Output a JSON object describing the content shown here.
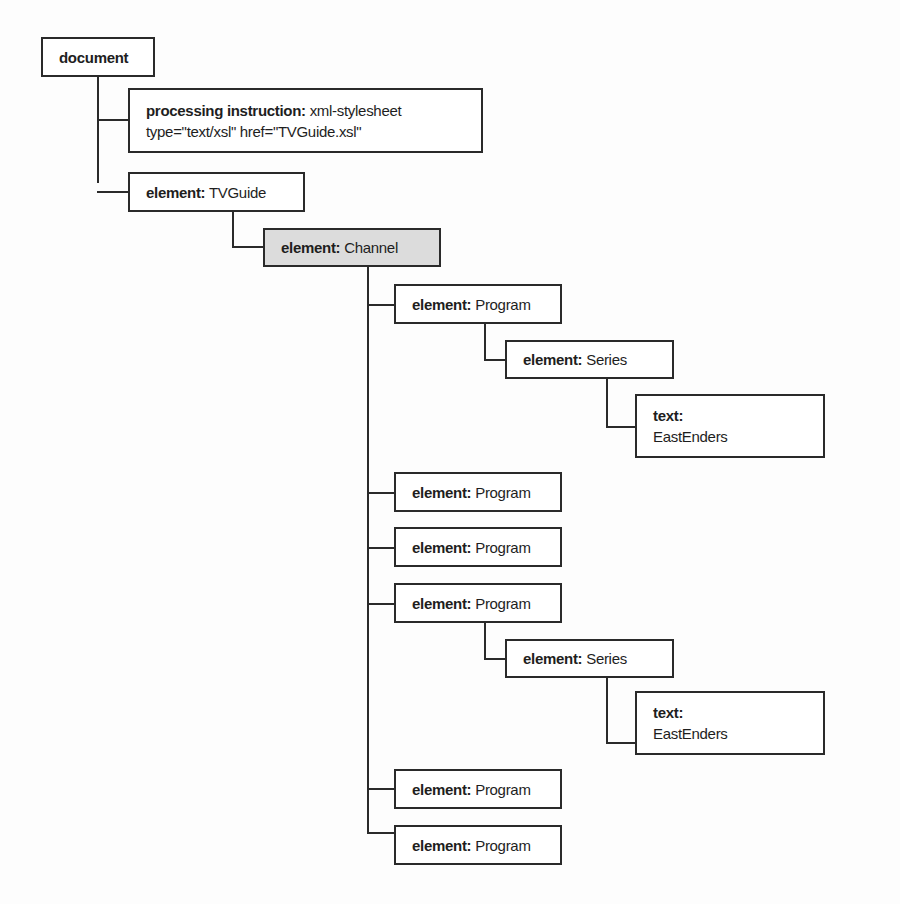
{
  "diagram": {
    "type": "xml-node-tree",
    "nodes": [
      {
        "id": "document",
        "kind": "document",
        "label": "document",
        "value": ""
      },
      {
        "id": "pi",
        "kind": "processing instruction:",
        "value": "xml-stylesheet",
        "value2": "type=\"text/xsl\" href=\"TVGuide.xsl\""
      },
      {
        "id": "tvguide",
        "kind": "element:",
        "value": "TVGuide"
      },
      {
        "id": "channel",
        "kind": "element:",
        "value": "Channel",
        "highlighted": true
      },
      {
        "id": "program1",
        "kind": "element:",
        "value": "Program"
      },
      {
        "id": "series1",
        "kind": "element:",
        "value": "Series"
      },
      {
        "id": "text1",
        "kind": "text:",
        "value": "EastEnders"
      },
      {
        "id": "program2",
        "kind": "element:",
        "value": "Program"
      },
      {
        "id": "program3",
        "kind": "element:",
        "value": "Program"
      },
      {
        "id": "program4",
        "kind": "element:",
        "value": "Program"
      },
      {
        "id": "series2",
        "kind": "element:",
        "value": "Series"
      },
      {
        "id": "text2",
        "kind": "text:",
        "value": "EastEnders"
      },
      {
        "id": "program5",
        "kind": "element:",
        "value": "Program"
      },
      {
        "id": "program6",
        "kind": "element:",
        "value": "Program"
      }
    ],
    "edges": [
      [
        "document",
        "pi"
      ],
      [
        "document",
        "tvguide"
      ],
      [
        "tvguide",
        "channel"
      ],
      [
        "channel",
        "program1"
      ],
      [
        "program1",
        "series1"
      ],
      [
        "series1",
        "text1"
      ],
      [
        "channel",
        "program2"
      ],
      [
        "channel",
        "program3"
      ],
      [
        "channel",
        "program4"
      ],
      [
        "program4",
        "series2"
      ],
      [
        "series2",
        "text2"
      ],
      [
        "channel",
        "program5"
      ],
      [
        "channel",
        "program6"
      ]
    ],
    "colors": {
      "border": "#2a2a2a",
      "highlight_fill": "#dcdcdc",
      "fill": "#ffffff"
    }
  }
}
